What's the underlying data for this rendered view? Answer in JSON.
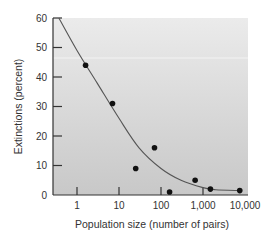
{
  "chart_data": {
    "type": "scatter",
    "title": "",
    "xlabel": "Population size (number of pairs)",
    "ylabel": "Extinctions (percent)",
    "xscale": "log",
    "xlim": [
      0.3,
      12000
    ],
    "ylim": [
      0,
      60
    ],
    "x_ticks": [
      1,
      10,
      100,
      1000,
      10000
    ],
    "x_tick_labels": [
      "1",
      "10",
      "100",
      "1,000",
      "10,000"
    ],
    "y_ticks": [
      0,
      10,
      20,
      30,
      40,
      50,
      60
    ],
    "y_tick_labels": [
      "0",
      "10",
      "20",
      "30",
      "40",
      "50",
      "60"
    ],
    "grid": false,
    "legend": null,
    "series": [
      {
        "name": "observed",
        "kind": "points",
        "points": [
          {
            "x": 1.6,
            "y": 44
          },
          {
            "x": 7,
            "y": 31
          },
          {
            "x": 25,
            "y": 9
          },
          {
            "x": 70,
            "y": 16
          },
          {
            "x": 160,
            "y": 1
          },
          {
            "x": 650,
            "y": 5
          },
          {
            "x": 1500,
            "y": 2
          },
          {
            "x": 7500,
            "y": 1.5
          }
        ]
      },
      {
        "name": "fitted curve",
        "kind": "line",
        "points": [
          {
            "x": 0.37,
            "y": 60
          },
          {
            "x": 1,
            "y": 49
          },
          {
            "x": 3,
            "y": 38
          },
          {
            "x": 10,
            "y": 26
          },
          {
            "x": 30,
            "y": 16
          },
          {
            "x": 100,
            "y": 9
          },
          {
            "x": 300,
            "y": 5
          },
          {
            "x": 1000,
            "y": 2.5
          },
          {
            "x": 2000,
            "y": 1.8
          },
          {
            "x": 7500,
            "y": 1.5
          }
        ]
      }
    ]
  },
  "colors": {
    "plot_bg_top": "#ebebeb",
    "plot_bg_bottom": "#c8c8c8",
    "axis": "#333333",
    "points": "#111111",
    "curve": "#555555"
  }
}
